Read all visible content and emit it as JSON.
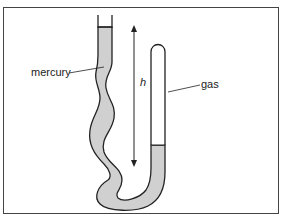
{
  "diagram": {
    "labels": {
      "mercury": "mercury",
      "gas": "gas",
      "height": "h"
    },
    "colors": {
      "mercury_fill": "#d0d0d0",
      "outline": "#222222",
      "frame": "#444444",
      "background": "#ffffff"
    }
  }
}
